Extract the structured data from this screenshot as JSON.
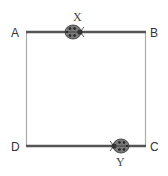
{
  "diagram": {
    "type": "square path with two ladybugs",
    "corners": {
      "A": "A",
      "B": "B",
      "C": "C",
      "D": "D"
    },
    "bugs": {
      "x": {
        "label": "X",
        "edge": "AB",
        "facing": "right"
      },
      "y": {
        "label": "Y",
        "edge": "DC",
        "facing": "left"
      }
    },
    "colors": {
      "horizontal_edge": "#555555",
      "vertical_edge": "#aaaaaa",
      "bug_body": "#777777",
      "bug_spots": "#222222"
    }
  }
}
